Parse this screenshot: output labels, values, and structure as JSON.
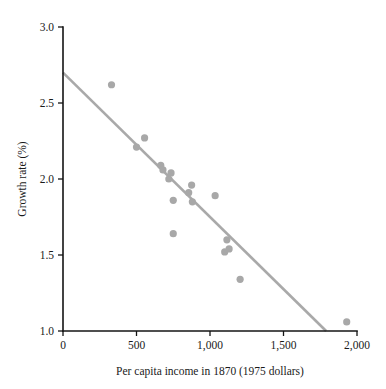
{
  "chart_data": {
    "type": "scatter",
    "title": "",
    "xlabel": "Per capita income in 1870 (1975 dollars)",
    "ylabel": "Growth rate (%)",
    "xlim": [
      0,
      2000
    ],
    "ylim": [
      1.0,
      3.0
    ],
    "grid": false,
    "legend": "none",
    "xticks": [
      0,
      500,
      1000,
      1500,
      2000
    ],
    "xticklabels": [
      "0",
      "500",
      "1,000",
      "1,500",
      "2,000"
    ],
    "yticks": [
      1.0,
      1.5,
      2.0,
      2.5,
      3.0
    ],
    "yticklabels": [
      "1.0",
      "1.5",
      "2.0",
      "2.5",
      "3.0"
    ],
    "marker_color": "#a8a8a8",
    "line_color": "#a9a9a9",
    "axis_color": "#141414",
    "points": [
      {
        "x": 330,
        "y": 2.62
      },
      {
        "x": 500,
        "y": 2.21
      },
      {
        "x": 555,
        "y": 2.27
      },
      {
        "x": 665,
        "y": 2.09
      },
      {
        "x": 680,
        "y": 2.06
      },
      {
        "x": 720,
        "y": 2.0
      },
      {
        "x": 735,
        "y": 2.04
      },
      {
        "x": 750,
        "y": 1.86
      },
      {
        "x": 750,
        "y": 1.64
      },
      {
        "x": 855,
        "y": 1.91
      },
      {
        "x": 875,
        "y": 1.96
      },
      {
        "x": 880,
        "y": 1.85
      },
      {
        "x": 1035,
        "y": 1.89
      },
      {
        "x": 1100,
        "y": 1.52
      },
      {
        "x": 1115,
        "y": 1.6
      },
      {
        "x": 1130,
        "y": 1.54
      },
      {
        "x": 1205,
        "y": 1.34
      },
      {
        "x": 1930,
        "y": 1.06
      }
    ],
    "trendline": {
      "x_start": 0,
      "y_start": 2.7,
      "x_end": 1790,
      "y_end": 1.0
    }
  }
}
